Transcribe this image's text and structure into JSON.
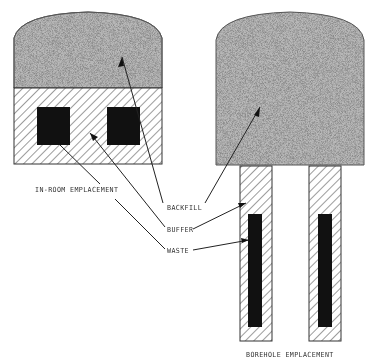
{
  "figure": {
    "type": "diagram",
    "panels": [
      {
        "id": "in-room",
        "label": "IN-ROOM EMPLACEMENT"
      },
      {
        "id": "borehole",
        "label": "BOREHOLE EMPLACEMENT"
      }
    ],
    "legend_labels": {
      "backfill": "BACKFILL",
      "buffer": "BUFFER",
      "waste": "WASTE"
    },
    "materials": {
      "backfill": {
        "pattern": "stipple",
        "color": "#9a9a9a"
      },
      "buffer": {
        "pattern": "diagonal-hatch",
        "color": "#3a3a3a"
      },
      "waste": {
        "pattern": "solid",
        "color": "#111111"
      }
    }
  }
}
